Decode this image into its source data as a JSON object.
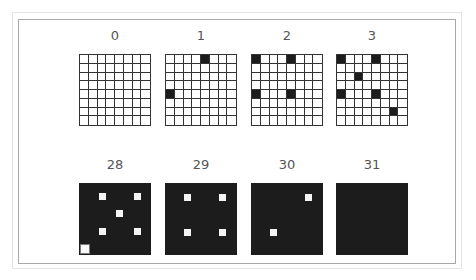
{
  "figure": {
    "grid_size": 8,
    "colors": {
      "filled": "#1c1c1c",
      "empty": "#ffffff",
      "grid_line": "#333333",
      "frame_border": "#a8a8a8",
      "label": "#555555"
    },
    "top_row": [
      {
        "label": "0",
        "mode": "light",
        "cells": []
      },
      {
        "label": "1",
        "mode": "light",
        "cells": [
          [
            0,
            4
          ],
          [
            4,
            0
          ]
        ]
      },
      {
        "label": "2",
        "mode": "light",
        "cells": [
          [
            0,
            0
          ],
          [
            0,
            4
          ],
          [
            4,
            0
          ],
          [
            4,
            4
          ]
        ]
      },
      {
        "label": "3",
        "mode": "light",
        "cells": [
          [
            0,
            0
          ],
          [
            0,
            4
          ],
          [
            2,
            2
          ],
          [
            4,
            0
          ],
          [
            4,
            4
          ],
          [
            6,
            6
          ]
        ]
      }
    ],
    "bottom_row": [
      {
        "label": "28",
        "mode": "dark",
        "holes": [
          [
            1,
            2
          ],
          [
            1,
            6
          ],
          [
            3,
            4
          ],
          [
            5,
            2
          ],
          [
            5,
            6
          ],
          [
            7,
            0
          ]
        ]
      },
      {
        "label": "29",
        "mode": "dark",
        "holes": [
          [
            1,
            2
          ],
          [
            1,
            6
          ],
          [
            5,
            2
          ],
          [
            5,
            6
          ]
        ]
      },
      {
        "label": "30",
        "mode": "dark",
        "holes": [
          [
            1,
            6
          ],
          [
            5,
            2
          ]
        ]
      },
      {
        "label": "31",
        "mode": "dark",
        "holes": []
      }
    ]
  }
}
